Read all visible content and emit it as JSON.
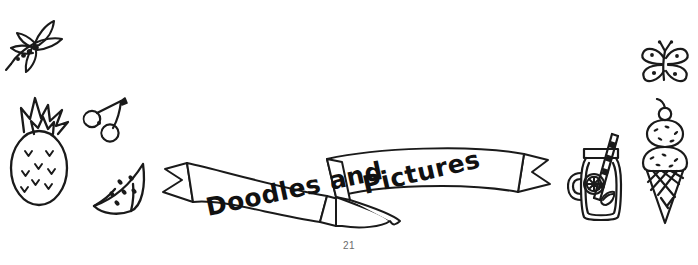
{
  "page": {
    "number": "21",
    "background_color": "#ffffff",
    "ink_color": "#1a1a1a"
  },
  "banner": {
    "name": "ribbon-banner",
    "text_left": "Doodles and",
    "text_right": "Pictures",
    "style": "hand-drawn ribbon with notched tails and folded center"
  },
  "doodles": [
    {
      "name": "dragonfly",
      "label": "Dragonfly",
      "position": "top-left"
    },
    {
      "name": "pineapple",
      "label": "Pineapple",
      "position": "left"
    },
    {
      "name": "cherries",
      "label": "Cherries",
      "position": "left"
    },
    {
      "name": "watermelon",
      "label": "Watermelon slice",
      "position": "left"
    },
    {
      "name": "butterfly",
      "label": "Butterfly",
      "position": "top-right"
    },
    {
      "name": "masonjar",
      "label": "Mason jar lemonade",
      "position": "right"
    },
    {
      "name": "icecream",
      "label": "Ice cream cone",
      "position": "right"
    }
  ]
}
